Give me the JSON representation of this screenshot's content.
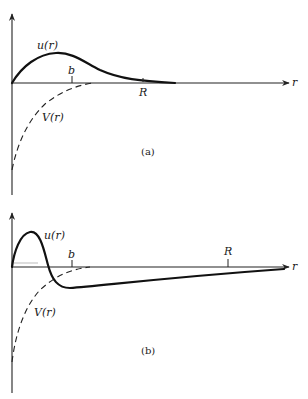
{
  "figure": {
    "panels": [
      {
        "id": "a",
        "caption": "(a)",
        "x_axis_label": "r",
        "curve_u_label": "u(r)",
        "curve_v_label": "V(r)",
        "tick_b_label": "b",
        "tick_R_label": "R",
        "description": "Bound-state wavefunction u(r) positive, peaks inside range b of attractive potential V(r), decays beyond R"
      },
      {
        "id": "b",
        "caption": "(b)",
        "x_axis_label": "r",
        "curve_u_label": "u(r)",
        "curve_v_label": "V(r)",
        "tick_b_label": "b",
        "tick_R_label": "R",
        "description": "Wavefunction u(r) peaks sharply, crosses zero near b, becomes negative and slowly approaches zero beyond R"
      }
    ],
    "colors": {
      "ink": "#111111",
      "background": "#ffffff"
    }
  }
}
